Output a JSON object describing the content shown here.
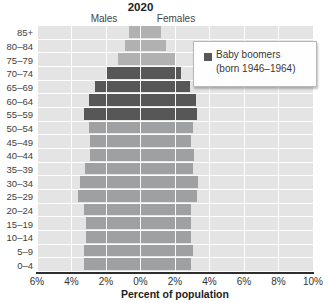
{
  "header": {
    "title": "2020",
    "left": "Males",
    "right": "Females"
  },
  "legend": {
    "line1": "Baby boomers",
    "line2": "(born 1946–1964)"
  },
  "x_axis_title": "Percent of population",
  "chart_data": {
    "type": "bar",
    "subtype": "population_pyramid",
    "title": "2020",
    "xlabel": "Percent of population",
    "categories": [
      "85+",
      "80–84",
      "75–79",
      "70–74",
      "65–69",
      "60–64",
      "55–59",
      "50–54",
      "45–49",
      "40–44",
      "35–39",
      "30–34",
      "25–29",
      "20–24",
      "15–19",
      "10–14",
      "5–9",
      "0–4"
    ],
    "series": [
      {
        "name": "Males",
        "side": "left",
        "values": [
          0.65,
          0.9,
          1.3,
          2.0,
          2.65,
          3.0,
          3.25,
          3.0,
          2.9,
          2.95,
          3.2,
          3.5,
          3.6,
          3.3,
          3.15,
          3.15,
          3.3,
          3.3
        ]
      },
      {
        "name": "Females",
        "side": "right",
        "values": [
          1.2,
          1.5,
          2.0,
          2.35,
          2.85,
          3.2,
          3.3,
          3.05,
          2.9,
          3.1,
          3.05,
          3.35,
          3.3,
          2.95,
          2.95,
          2.9,
          3.05,
          2.9
        ]
      }
    ],
    "x_tick_labels": [
      "6%",
      "4%",
      "2%",
      "0%",
      "2%",
      "4%",
      "6%",
      "8%",
      "10%"
    ],
    "x_range": {
      "left_max": 6,
      "right_max": 10,
      "tick_step": 2
    },
    "grid": "white lines over gray panel",
    "legend_position": "upper right",
    "highlight": {
      "label": "Baby boomers (born 1946–1964)",
      "rows": [
        "70–74",
        "65–69",
        "60–64",
        "55–59"
      ]
    },
    "row_groups": [
      "pre",
      "pre",
      "pre",
      "boomer",
      "boomer",
      "boomer",
      "boomer",
      "post",
      "post",
      "post",
      "post",
      "post",
      "post",
      "post",
      "post",
      "post",
      "post",
      "post"
    ],
    "colors": {
      "pre": "#b1b1b1",
      "boomer": "#575757",
      "post": "#9fa0a1",
      "panel": "#e4e4e5",
      "grid_line": "#ffffff",
      "axis_line": "#2e2e2e",
      "legend_swatch": "#575757"
    }
  }
}
